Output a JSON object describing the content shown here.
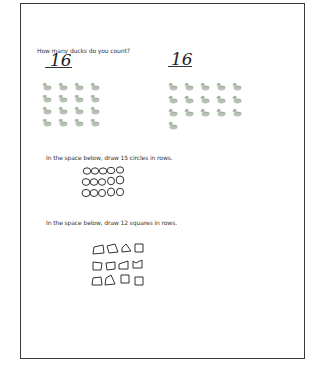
{
  "worksheet": {
    "question_ducks": "How many ducks do you count?",
    "answer_left": "16",
    "answer_right": "16",
    "duck_groups": [
      {
        "name": "left",
        "columns": 4,
        "count": 16
      },
      {
        "name": "right",
        "columns": 5,
        "count": 16
      }
    ],
    "instruction_circles": "In the space below, draw 15 circles in rows.",
    "circles_drawn": {
      "rows": 3,
      "per_row": 5,
      "count": 15
    },
    "instruction_squares": "In the space below, draw 12 squares in rows.",
    "squares_drawn": {
      "rows": 3,
      "per_row": 4,
      "count": 12
    }
  },
  "icons": {
    "duck": "duck-icon"
  },
  "colors": {
    "border": "#3a3a3a",
    "duck": "#9aaa98",
    "pencil": "#333333"
  }
}
